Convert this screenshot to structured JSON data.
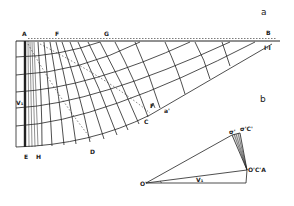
{
  "figure": {
    "parts": [
      {
        "id": "a",
        "label": "a"
      },
      {
        "id": "b",
        "label": "b"
      }
    ],
    "colors": {
      "ink": "#222222",
      "paper": "#ffffff"
    },
    "mesh_labels": {
      "A": "A",
      "F": "F",
      "G": "G",
      "B": "B",
      "II": "I·I",
      "V1": "V₁",
      "E": "E",
      "H": "H",
      "D": "D",
      "C": "C",
      "F2": "F",
      "a_prime": "a'"
    },
    "hodograph_labels": {
      "O_prime": "O'",
      "angle": "ω",
      "V1": "V₁",
      "O_C_A": "O'C'A",
      "sigma": "σ'",
      "sigma_C": "σ'C'"
    }
  }
}
